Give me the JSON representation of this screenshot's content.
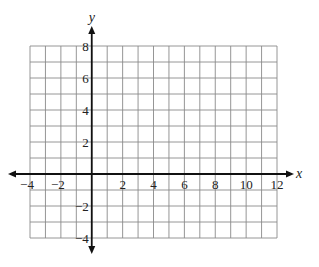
{
  "chart_data": {
    "type": "coordinate-grid",
    "title": "",
    "xlabel": "x",
    "ylabel": "y",
    "xlim": [
      -4,
      12
    ],
    "ylim": [
      -4,
      8
    ],
    "grid": true,
    "grid_step": 1,
    "x_tick_labels": [
      "−4",
      "−2",
      "2",
      "4",
      "6",
      "8",
      "10",
      "12"
    ],
    "x_tick_values": [
      -4,
      -2,
      2,
      4,
      6,
      8,
      10,
      12
    ],
    "y_tick_labels": [
      "8",
      "6",
      "4",
      "2",
      "−2",
      "−4"
    ],
    "y_tick_values": [
      8,
      6,
      4,
      2,
      -2,
      -4
    ],
    "series": []
  },
  "axes": {
    "x_name": "x",
    "y_name": "y"
  }
}
